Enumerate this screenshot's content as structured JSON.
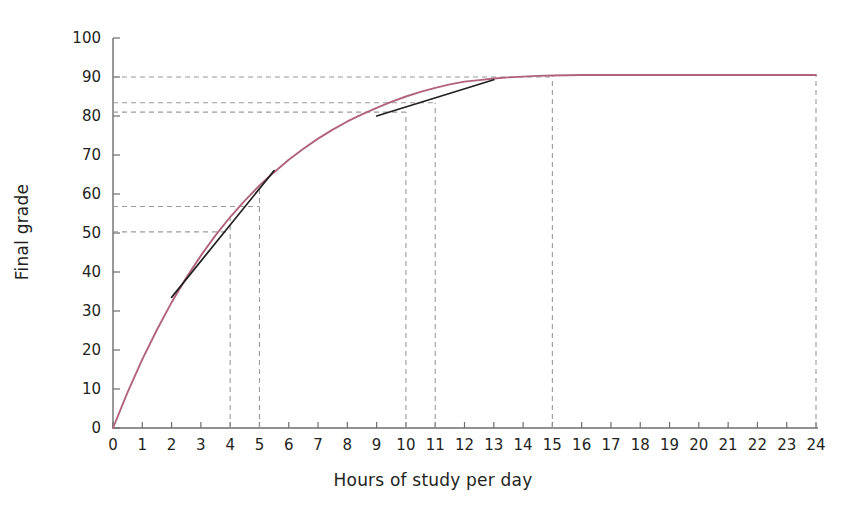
{
  "chart_data": {
    "type": "line",
    "title": "",
    "xlabel": "Hours of study per day",
    "ylabel": "Final grade",
    "xlim": [
      0,
      24
    ],
    "ylim": [
      0,
      100
    ],
    "xticks": [
      0,
      1,
      2,
      3,
      4,
      5,
      6,
      7,
      8,
      9,
      10,
      11,
      12,
      13,
      14,
      15,
      16,
      17,
      18,
      19,
      20,
      21,
      22,
      23,
      24
    ],
    "yticks": [
      0,
      10,
      20,
      30,
      40,
      50,
      60,
      70,
      80,
      90,
      100
    ],
    "grid": false,
    "legend": null,
    "series": [
      {
        "name": "Final grade vs hours of study",
        "color": "#b1637c",
        "style": "solid",
        "description": "Saturating (diminishing returns) curve rising from 0 to a plateau of about 90.5",
        "x": [
          0,
          0.5,
          1,
          1.5,
          2,
          2.5,
          3,
          3.5,
          4,
          4.5,
          5,
          5.5,
          6,
          6.5,
          7,
          7.5,
          8,
          8.5,
          9,
          9.5,
          10,
          10.5,
          11,
          11.5,
          12,
          12.5,
          13,
          13.5,
          14,
          14.5,
          15,
          16,
          17,
          18,
          19,
          20,
          21,
          22,
          23,
          24
        ],
        "y": [
          0,
          9.2,
          17.6,
          25.2,
          32.2,
          38.5,
          44.2,
          49.4,
          54.1,
          58.3,
          62.2,
          65.6,
          68.8,
          71.6,
          74.2,
          76.5,
          78.6,
          80.4,
          82.1,
          83.6,
          85.0,
          86.2,
          87.2,
          88.1,
          88.8,
          89.2,
          89.6,
          89.9,
          90.1,
          90.3,
          90.4,
          90.5,
          90.5,
          90.5,
          90.5,
          90.5,
          90.5,
          90.5,
          90.5,
          90.5
        ]
      },
      {
        "name": "Tangent at 4 hours",
        "color": "#221f1f",
        "style": "solid",
        "description": "Steep tangent line touching the curve at x = 4, grade = 54",
        "x": [
          2.0,
          5.5
        ],
        "y": [
          33.5,
          66.0
        ]
      },
      {
        "name": "Tangent at 10.5 hours",
        "color": "#221f1f",
        "style": "solid",
        "description": "Shallow tangent line touching the curve between x = 10 and x = 11",
        "x": [
          9.0,
          13.0
        ],
        "y": [
          80.0,
          89.3
        ]
      }
    ],
    "reference_lines": {
      "vertical": [
        {
          "x": 4,
          "to_y": 54.1,
          "style": "dashed",
          "color": "#9a9a9a"
        },
        {
          "x": 5,
          "to_y": 62.2,
          "style": "dashed",
          "color": "#9a9a9a"
        },
        {
          "x": 10,
          "to_y": 81.0,
          "style": "dashed",
          "color": "#9a9a9a"
        },
        {
          "x": 11,
          "to_y": 83.4,
          "style": "dashed",
          "color": "#9a9a9a"
        },
        {
          "x": 15,
          "to_y": 90.4,
          "style": "dashed",
          "color": "#9a9a9a"
        },
        {
          "x": 24,
          "to_y": 90.5,
          "style": "dashed",
          "color": "#9a9a9a"
        }
      ],
      "horizontal": [
        {
          "y": 50.3,
          "to_x": 4,
          "style": "dashed",
          "color": "#9a9a9a"
        },
        {
          "y": 56.8,
          "to_x": 5,
          "style": "dashed",
          "color": "#9a9a9a"
        },
        {
          "y": 81.0,
          "to_x": 10,
          "style": "dashed",
          "color": "#9a9a9a"
        },
        {
          "y": 83.4,
          "to_x": 11,
          "style": "dashed",
          "color": "#9a9a9a"
        },
        {
          "y": 90.0,
          "to_x": 15,
          "style": "dashed",
          "color": "#9a9a9a"
        }
      ]
    },
    "colors": {
      "curve": "#b1637c",
      "tangent": "#221f1f",
      "axis": "#6d6d6d",
      "reference": "#9a9a9a",
      "text": "#231f20",
      "background": "#ffffff"
    }
  }
}
